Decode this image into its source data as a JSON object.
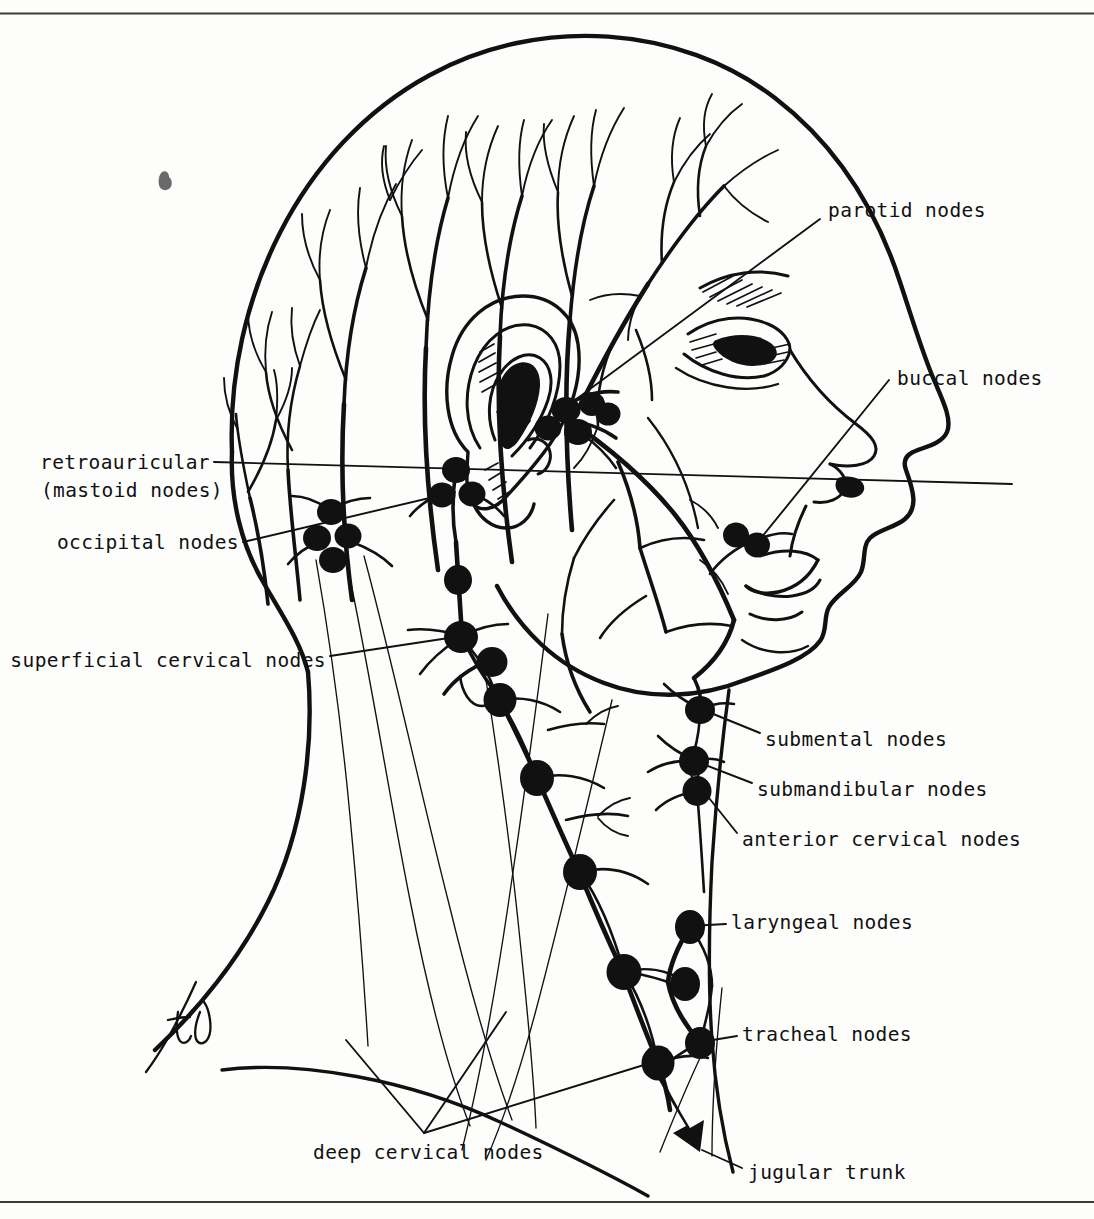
{
  "figure": {
    "view": "right lateral profile of a head and neck",
    "artist_signature": "td",
    "ink_color": "#111111",
    "paper_color": "#fdfdfc",
    "border": {
      "top_rule": true,
      "bottom_rule": true
    }
  },
  "labels": [
    {
      "id": "parotid",
      "text": "parotid nodes",
      "side": "right",
      "x": 828,
      "y": 198,
      "leader_from": [
        820,
        219
      ],
      "leader_to": [
        565,
        408
      ]
    },
    {
      "id": "buccal",
      "text": "buccal nodes",
      "side": "right",
      "x": 897,
      "y": 366,
      "leader_from": [
        889,
        387
      ],
      "leader_to": [
        757,
        540
      ]
    },
    {
      "id": "retroauricular",
      "text": "retroauricular",
      "side": "left",
      "x": 76,
      "y": 450,
      "leader_from": [
        214,
        466
      ],
      "leader_to": [
        457,
        494
      ]
    },
    {
      "id": "mastoid",
      "text": "(mastoid nodes)",
      "side": "left",
      "x": 76,
      "y": 478,
      "leader_from": null,
      "leader_to": null
    },
    {
      "id": "occipital",
      "text": "occipital nodes",
      "side": "left",
      "x": 76,
      "y": 530,
      "leader_from": [
        243,
        540
      ],
      "leader_to": [
        452,
        490
      ]
    },
    {
      "id": "superficial_cervical",
      "text": "superficial cervical nodes",
      "side": "left",
      "x": 57,
      "y": 648,
      "leader_from": [
        330,
        658
      ],
      "leader_to": [
        460,
        636
      ]
    },
    {
      "id": "submental",
      "text": "submental nodes",
      "side": "right",
      "x": 765,
      "y": 727,
      "leader_from": [
        757,
        738
      ],
      "leader_to": [
        700,
        709
      ]
    },
    {
      "id": "submandibular",
      "text": "submandibular nodes",
      "side": "right",
      "x": 757,
      "y": 777,
      "leader_from": [
        749,
        788
      ],
      "leader_to": [
        694,
        760
      ]
    },
    {
      "id": "anterior_cervical",
      "text": "anterior cervical nodes",
      "side": "right",
      "x": 742,
      "y": 827,
      "leader_from": [
        734,
        838
      ],
      "leader_to": [
        697,
        790
      ]
    },
    {
      "id": "laryngeal",
      "text": "laryngeal nodes",
      "side": "right",
      "x": 731,
      "y": 918,
      "leader_from": [
        723,
        928
      ],
      "leader_to": [
        690,
        927
      ]
    },
    {
      "id": "tracheal",
      "text": "tracheal nodes",
      "side": "right",
      "x": 742,
      "y": 1030,
      "leader_from": [
        734,
        1040
      ],
      "leader_to": [
        700,
        1043
      ]
    },
    {
      "id": "deep_cervical",
      "text": "deep cervical nodes",
      "side": "right",
      "x": 313,
      "y": 1145,
      "leader_from": [
        424,
        1133
      ],
      "leader_to": [
        440,
        1106
      ]
    },
    {
      "id": "jugular_trunk",
      "text": "jugular trunk",
      "side": "right",
      "x": 748,
      "y": 1165,
      "leader_from": [
        740,
        1175
      ],
      "leader_to": [
        700,
        1155
      ]
    }
  ],
  "node_groups": [
    {
      "id": "parotid-cluster",
      "label": "parotid nodes",
      "count": 5,
      "note": "preauricular cluster in front of the ear"
    },
    {
      "id": "buccal-node",
      "label": "buccal nodes",
      "count": 1,
      "note": "over the cheek near the angle of the mouth"
    },
    {
      "id": "retroauricular-cluster",
      "label": "retroauricular (mastoid nodes)",
      "count": 3,
      "note": "behind the ear over the mastoid"
    },
    {
      "id": "occipital-cluster",
      "label": "occipital nodes",
      "count": 4,
      "note": "at the back of the skull base"
    },
    {
      "id": "superficial-cervical",
      "label": "superficial cervical nodes",
      "count": 3,
      "note": "along the external jugular vein"
    },
    {
      "id": "submental-node",
      "label": "submental nodes",
      "count": 1,
      "note": "beneath the chin"
    },
    {
      "id": "submandibular-nodes",
      "label": "submandibular nodes",
      "count": 2,
      "note": "under the lower jaw"
    },
    {
      "id": "anterior-cervical",
      "label": "anterior cervical nodes",
      "count": 2,
      "note": "front of the neck"
    },
    {
      "id": "laryngeal-node",
      "label": "laryngeal nodes",
      "count": 2,
      "note": "over the larynx"
    },
    {
      "id": "tracheal-nodes",
      "label": "tracheal nodes",
      "count": 2,
      "note": "beside the trachea"
    },
    {
      "id": "deep-cervical-chain",
      "label": "deep cervical nodes",
      "count": 7,
      "note": "chain running down the great vessels of the neck"
    }
  ],
  "anatomy_features": [
    "scalp lymphatic vessel tree",
    "external ear with helix, antihelix, concha and lobe",
    "eyebrow and eye with hatched shading",
    "nose with nostril",
    "lips and chin",
    "mandible border",
    "sternocleidomastoid outline",
    "clavicle and shoulder line",
    "jugular trunk arrow"
  ]
}
